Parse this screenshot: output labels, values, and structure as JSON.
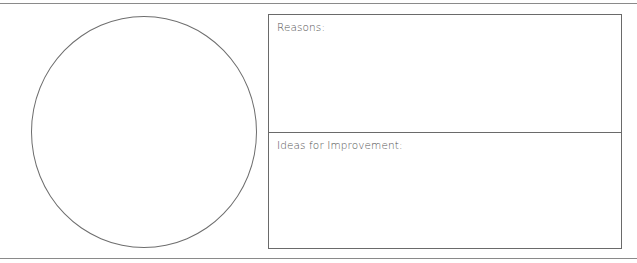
{
  "worksheet": {
    "sections": [
      {
        "label": "Reasons:"
      },
      {
        "label": "Ideas for Improvement:"
      }
    ],
    "circle": {
      "content": ""
    }
  }
}
